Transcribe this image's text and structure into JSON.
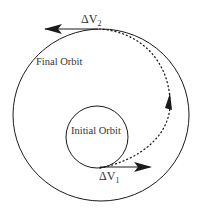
{
  "diagram": {
    "labels": {
      "final_orbit": "Final Orbit",
      "initial_orbit": "Initial Orbit",
      "dv2_main": "ΔV",
      "dv2_sub": "2",
      "dv1_main": "ΔV",
      "dv1_sub": "1"
    },
    "colors": {
      "stroke": "#1a1a1a",
      "text": "#333333",
      "background": "#ffffff"
    }
  }
}
